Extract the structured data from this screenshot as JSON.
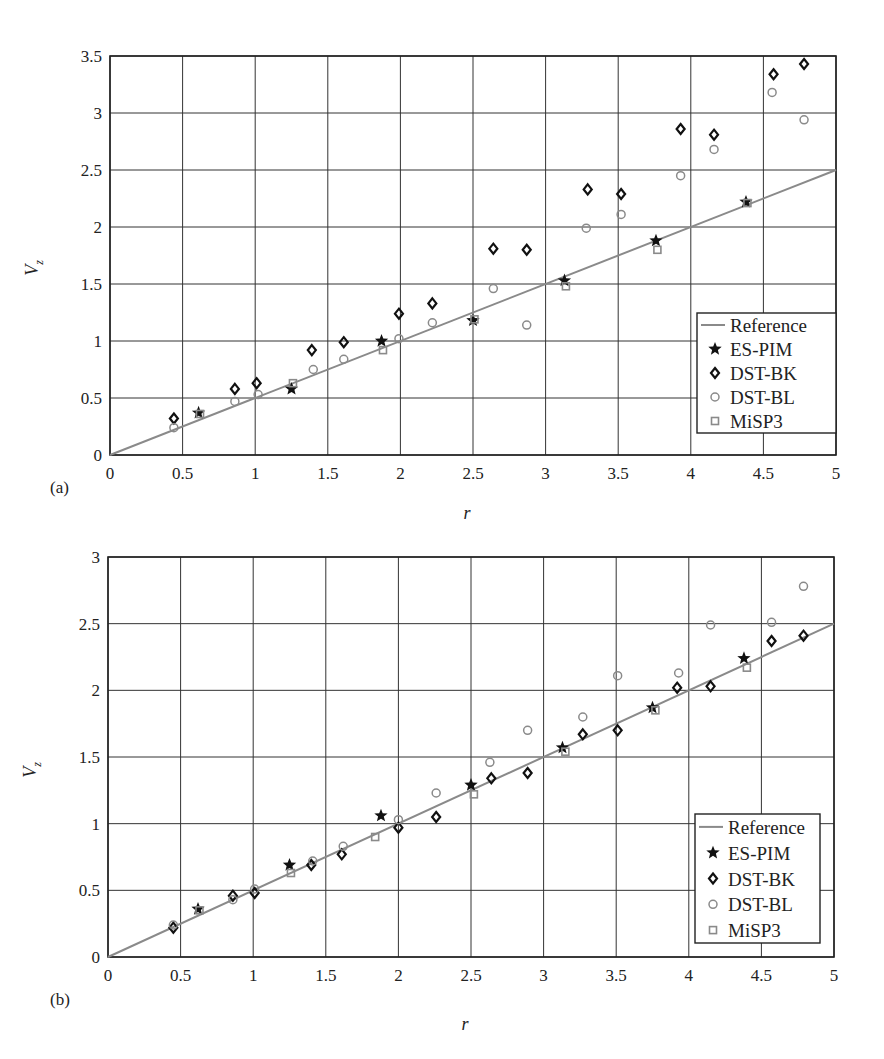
{
  "chart_data": [
    {
      "panel_label": "(a)",
      "type": "scatter",
      "xlabel": "r",
      "ylabel": "V_z",
      "xlim": [
        0,
        5
      ],
      "ylim": [
        0,
        3.5
      ],
      "xticks": [
        "0",
        "0.5",
        "1",
        "1.5",
        "2",
        "2.5",
        "3",
        "3.5",
        "4",
        "4.5",
        "5"
      ],
      "yticks": [
        "0",
        "0.5",
        "1",
        "1.5",
        "2",
        "2.5",
        "3",
        "3.5"
      ],
      "grid": true,
      "legend_position": "lower right",
      "series": [
        {
          "name": "Reference",
          "marker": "line",
          "color": "#8a8a8a",
          "x": [
            0,
            5
          ],
          "y": [
            0,
            2.5
          ]
        },
        {
          "name": "ES-PIM",
          "marker": "star",
          "color": "#111111",
          "x": [
            0.61,
            1.25,
            1.87,
            2.5,
            3.13,
            3.76,
            4.38
          ],
          "y": [
            0.37,
            0.58,
            1.0,
            1.18,
            1.53,
            1.88,
            2.22
          ]
        },
        {
          "name": "DST-BK",
          "marker": "diamond",
          "color": "#111111",
          "x": [
            0.44,
            0.86,
            1.01,
            1.39,
            1.61,
            1.99,
            2.22,
            2.64,
            2.87,
            3.29,
            3.52,
            3.93,
            4.16,
            4.57,
            4.78
          ],
          "y": [
            0.32,
            0.58,
            0.63,
            0.92,
            0.99,
            1.24,
            1.33,
            1.81,
            1.8,
            2.33,
            2.29,
            2.86,
            2.81,
            3.34,
            3.43
          ]
        },
        {
          "name": "DST-BL",
          "marker": "circle",
          "color": "#8a8a8a",
          "x": [
            0.44,
            0.86,
            1.02,
            1.4,
            1.61,
            1.99,
            2.22,
            2.64,
            2.87,
            3.28,
            3.52,
            3.93,
            4.16,
            4.56,
            4.78
          ],
          "y": [
            0.24,
            0.47,
            0.53,
            0.75,
            0.84,
            1.02,
            1.16,
            1.46,
            1.14,
            1.99,
            2.11,
            2.45,
            2.68,
            3.18,
            2.94
          ]
        },
        {
          "name": "MiSP3",
          "marker": "square",
          "color": "#8a8a8a",
          "x": [
            0.62,
            1.26,
            1.88,
            2.51,
            3.14,
            3.77,
            4.39
          ],
          "y": [
            0.36,
            0.63,
            0.92,
            1.19,
            1.48,
            1.8,
            2.21
          ]
        }
      ]
    },
    {
      "panel_label": "(b)",
      "type": "scatter",
      "xlabel": "r",
      "ylabel": "V_z",
      "xlim": [
        0,
        5
      ],
      "ylim": [
        0,
        3
      ],
      "xticks": [
        "0",
        "0.5",
        "1",
        "1.5",
        "2",
        "2.5",
        "3",
        "3.5",
        "4",
        "4.5",
        "5"
      ],
      "yticks": [
        "0",
        "0.5",
        "1",
        "1.5",
        "2",
        "2.5",
        "3"
      ],
      "grid": true,
      "legend_position": "lower right",
      "series": [
        {
          "name": "Reference",
          "marker": "line",
          "color": "#8a8a8a",
          "x": [
            0,
            5
          ],
          "y": [
            0,
            2.5
          ]
        },
        {
          "name": "ES-PIM",
          "marker": "star",
          "color": "#111111",
          "x": [
            0.62,
            1.25,
            1.88,
            2.5,
            3.13,
            3.75,
            4.38
          ],
          "y": [
            0.36,
            0.69,
            1.06,
            1.29,
            1.57,
            1.87,
            2.24
          ]
        },
        {
          "name": "DST-BK",
          "marker": "diamond",
          "color": "#111111",
          "x": [
            0.45,
            0.86,
            1.01,
            1.4,
            1.61,
            2.0,
            2.26,
            2.64,
            2.89,
            3.27,
            3.51,
            3.92,
            4.15,
            4.57,
            4.79
          ],
          "y": [
            0.22,
            0.46,
            0.48,
            0.69,
            0.77,
            0.97,
            1.05,
            1.34,
            1.38,
            1.67,
            1.7,
            2.02,
            2.03,
            2.37,
            2.41
          ]
        },
        {
          "name": "DST-BL",
          "marker": "circle",
          "color": "#8a8a8a",
          "x": [
            0.45,
            0.86,
            1.01,
            1.41,
            1.62,
            2.0,
            2.26,
            2.63,
            2.89,
            3.27,
            3.51,
            3.93,
            4.15,
            4.57,
            4.79
          ],
          "y": [
            0.24,
            0.43,
            0.51,
            0.72,
            0.83,
            1.03,
            1.23,
            1.46,
            1.7,
            1.8,
            2.11,
            2.13,
            2.49,
            2.51,
            2.78
          ]
        },
        {
          "name": "MiSP3",
          "marker": "square",
          "color": "#8a8a8a",
          "x": [
            0.63,
            1.26,
            1.84,
            2.52,
            3.15,
            3.77,
            4.4
          ],
          "y": [
            0.35,
            0.63,
            0.9,
            1.22,
            1.54,
            1.85,
            2.17
          ]
        }
      ]
    }
  ]
}
